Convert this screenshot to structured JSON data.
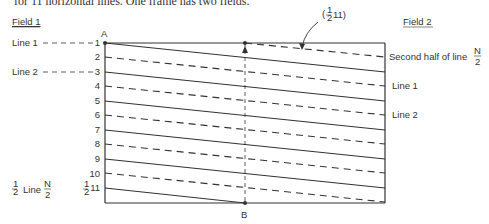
{
  "caption": "for 11 horizontal lines. One frame has two fields.",
  "field1": {
    "title": "Field 1",
    "labels": [
      {
        "text": "Line 1",
        "row": 1
      },
      {
        "text": "Line 2",
        "row": 3
      }
    ],
    "half_line": {
      "prefix": "1/2",
      "text": "Line",
      "frac": "N/2"
    }
  },
  "field2": {
    "title": "Field 2",
    "labels": [
      {
        "text": "Second half of line",
        "frac": "N/2"
      },
      {
        "text": "Line 1"
      },
      {
        "text": "Line 2"
      }
    ]
  },
  "points": {
    "a": "A",
    "b": "B"
  },
  "callout": "(1/2 11)",
  "row_numbers": [
    "1",
    "2",
    "3",
    "4",
    "5",
    "6",
    "7",
    "8",
    "9",
    "10",
    "11"
  ],
  "half_prefix": "1/2"
}
